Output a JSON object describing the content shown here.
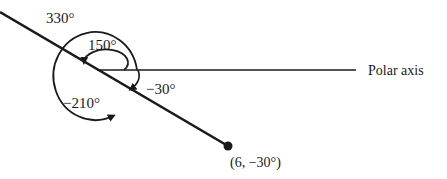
{
  "diagram": {
    "type": "polar-coordinates-angle-diagram",
    "axis_label": "Polar axis",
    "point_label": "(6, −30°)",
    "angles": [
      {
        "label": "330°",
        "description": "ray angle measured counterclockwise one direction"
      },
      {
        "label": "150°",
        "description": "small counterclockwise arc from polar axis"
      },
      {
        "label": "−30°",
        "description": "small clockwise arc from polar axis"
      },
      {
        "label": "−210°",
        "description": "large clockwise arc from polar axis"
      }
    ],
    "colors": {
      "line": "#1a1a1a",
      "background": "#ffffff"
    }
  }
}
